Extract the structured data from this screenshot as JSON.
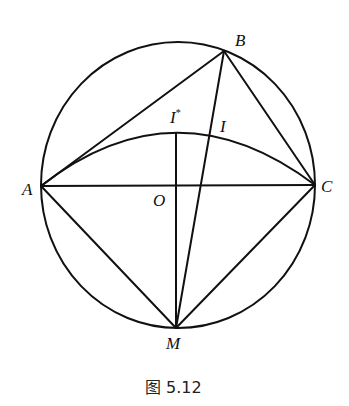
{
  "diagram": {
    "points": {
      "A": {
        "label": "A",
        "x": 41,
        "y": 186
      },
      "B": {
        "label": "B",
        "x": 224,
        "y": 51
      },
      "C": {
        "label": "C",
        "x": 315,
        "y": 185
      },
      "O": {
        "label": "O",
        "x": 176,
        "y": 186
      },
      "M": {
        "label": "M",
        "x": 176,
        "y": 328
      },
      "Istar": {
        "label": "I*",
        "x": 176,
        "y": 133
      },
      "I": {
        "label": "I",
        "x": 210,
        "y": 133
      }
    },
    "segments": [
      "AB",
      "BC",
      "AC",
      "AM",
      "CM",
      "BM",
      "MI*"
    ],
    "circle": {
      "cx": 178,
      "cy": 185,
      "rx": 137,
      "ry": 143
    },
    "arc": "A-I*-C"
  },
  "labels": {
    "A": "A",
    "B": "B",
    "C": "C",
    "O": "O",
    "M": "M",
    "I": "I",
    "Istar_base": "I",
    "Istar_sup": "*"
  },
  "caption": "图 5.12",
  "colors": {
    "stroke": "#111111",
    "background": "#ffffff"
  }
}
